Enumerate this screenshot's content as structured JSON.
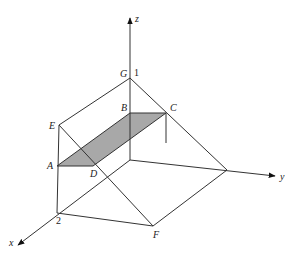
{
  "diagram": {
    "type": "3d-prism-with-shaded-plane",
    "axes": {
      "x": "x",
      "y": "y",
      "z": "z"
    },
    "points": {
      "A": "A",
      "B": "B",
      "C": "C",
      "D": "D",
      "E": "E",
      "F": "F",
      "G": "G"
    },
    "ticks": {
      "z_one": "1",
      "x_two": "2"
    },
    "colors": {
      "line": "#333333",
      "shade": "#a8a8a8",
      "background": "#ffffff"
    }
  }
}
